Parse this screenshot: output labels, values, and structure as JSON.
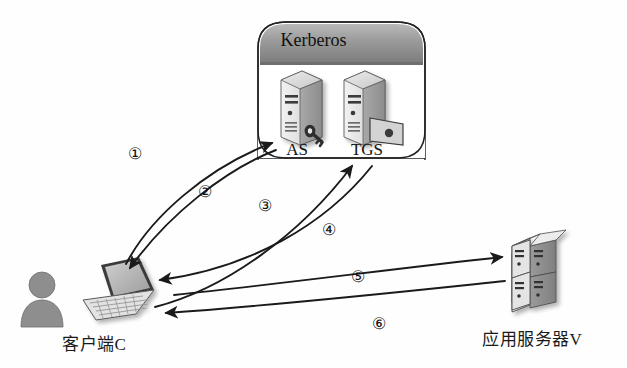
{
  "diagram": {
    "title_text": "Kerberos",
    "background": "#fefefe",
    "line_color": "#1a1a1a"
  },
  "kerberos_box": {
    "header_label": "Kerberos",
    "header_color": "#8f8f8f",
    "body_color": "#ffffff",
    "servers": [
      {
        "id": "as",
        "label": "AS",
        "icon": "server-tower-with-key-icon"
      },
      {
        "id": "tgs",
        "label": "TGS",
        "icon": "server-tower-with-ticket-icon"
      }
    ]
  },
  "nodes": [
    {
      "id": "client",
      "label": "客户端C",
      "icons": [
        "user-silhouette-icon",
        "laptop-icon"
      ]
    },
    {
      "id": "appserver",
      "label": "应用服务器V",
      "icons": [
        "rack-server-icon"
      ]
    }
  ],
  "steps": [
    {
      "num": "①",
      "from": "client",
      "to": "as",
      "direction": "up-right"
    },
    {
      "num": "②",
      "from": "as",
      "to": "client",
      "direction": "down-left"
    },
    {
      "num": "③",
      "from": "client",
      "to": "tgs",
      "direction": "up-right"
    },
    {
      "num": "④",
      "from": "tgs",
      "to": "client",
      "direction": "down-left"
    },
    {
      "num": "⑤",
      "from": "client",
      "to": "appserver",
      "direction": "right"
    },
    {
      "num": "⑥",
      "from": "appserver",
      "to": "client",
      "direction": "left"
    }
  ]
}
